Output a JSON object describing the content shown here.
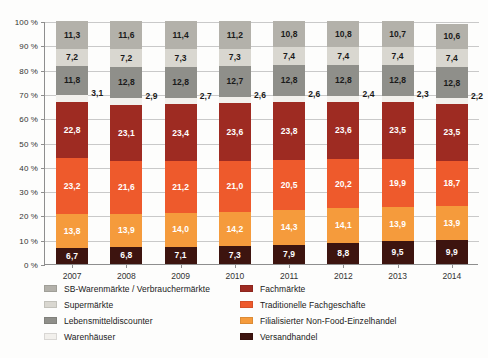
{
  "chart_data": {
    "type": "bar",
    "subtype": "stacked-percentage-column",
    "title": "",
    "xlabel": "",
    "ylabel": "",
    "ylim": [
      0,
      100
    ],
    "ytick_labels": [
      "0 %",
      "10 %",
      "20 %",
      "30 %",
      "40 %",
      "50 %",
      "60 %",
      "70 %",
      "80 %",
      "90 %",
      "100 %"
    ],
    "ytick_values": [
      0,
      10,
      20,
      30,
      40,
      50,
      60,
      70,
      80,
      90,
      100
    ],
    "grid": true,
    "legend_position": "bottom",
    "categories": [
      "2007",
      "2008",
      "2009",
      "2010",
      "2011",
      "2012",
      "2013",
      "2014"
    ],
    "stack_order_bottom_to_top": [
      "Versandhandel",
      "Filialisierter Non-Food-Einzelhandel",
      "Traditionelle Fachgeschäfte",
      "Fachmärkte",
      "Warenhäuser",
      "Lebensmitteldiscounter",
      "Supermärkte",
      "SB-Warenmärkte / Verbrauchermärkte"
    ],
    "series": [
      {
        "name": "Versandhandel",
        "color": "#3d140f",
        "label_color": "#ffffff",
        "label_position": "inside",
        "values": [
          6.7,
          6.8,
          7.1,
          7.3,
          7.9,
          8.8,
          9.5,
          9.9
        ],
        "value_labels": [
          "6,7",
          "6,8",
          "7,1",
          "7,3",
          "7,9",
          "8,8",
          "9,5",
          "9,9"
        ]
      },
      {
        "name": "Filialisierter Non-Food-Einzelhandel",
        "color": "#f59b3c",
        "label_color": "#ffffff",
        "label_position": "inside",
        "values": [
          13.8,
          13.9,
          14.0,
          14.2,
          14.3,
          14.1,
          13.9,
          13.9
        ],
        "value_labels": [
          "13,8",
          "13,9",
          "14,0",
          "14,2",
          "14,3",
          "14,1",
          "13,9",
          "13,9"
        ]
      },
      {
        "name": "Traditionelle Fachgeschäfte",
        "color": "#ee5a2c",
        "label_color": "#ffffff",
        "label_position": "inside",
        "values": [
          23.2,
          21.6,
          21.2,
          21.0,
          20.5,
          20.2,
          19.9,
          18.7
        ],
        "value_labels": [
          "23,2",
          "21,6",
          "21,2",
          "21,0",
          "20,5",
          "20,2",
          "19,9",
          "18,7"
        ]
      },
      {
        "name": "Fachmärkte",
        "color": "#9e2b22",
        "label_color": "#ffffff",
        "label_position": "inside",
        "values": [
          22.8,
          23.1,
          23.4,
          23.6,
          23.8,
          23.6,
          23.5,
          23.5
        ],
        "value_labels": [
          "22,8",
          "23,1",
          "23,4",
          "23,6",
          "23,8",
          "23,6",
          "23,5",
          "23,5"
        ]
      },
      {
        "name": "Warenhäuser",
        "color": "#f2f0ec",
        "label_color": "#1a1a1a",
        "label_position": "outside-right",
        "values": [
          3.1,
          2.9,
          2.7,
          2.6,
          2.6,
          2.4,
          2.3,
          2.2
        ],
        "value_labels": [
          "3,1",
          "2,9",
          "2,7",
          "2,6",
          "2,6",
          "2,4",
          "2,3",
          "2,2"
        ]
      },
      {
        "name": "Lebensmitteldiscounter",
        "color": "#8f8f8a",
        "label_color": "#1a1a1a",
        "label_position": "inside",
        "values": [
          11.8,
          12.8,
          12.8,
          12.7,
          12.8,
          12.8,
          12.8,
          12.8
        ],
        "value_labels": [
          "11,8",
          "12,8",
          "12,8",
          "12,7",
          "12,8",
          "12,8",
          "12,8",
          "12,8"
        ]
      },
      {
        "name": "Supermärkte",
        "color": "#d9d7d0",
        "label_color": "#1a1a1a",
        "label_position": "inside",
        "values": [
          7.2,
          7.2,
          7.3,
          7.3,
          7.4,
          7.4,
          7.4,
          7.4
        ],
        "value_labels": [
          "7,2",
          "7,2",
          "7,3",
          "7,3",
          "7,4",
          "7,4",
          "7,4",
          "7,4"
        ]
      },
      {
        "name": "SB-Warenmärkte / Verbrauchermärkte",
        "color": "#b3b1aa",
        "label_color": "#1a1a1a",
        "label_position": "inside",
        "values": [
          11.3,
          11.6,
          11.4,
          11.2,
          10.8,
          10.8,
          10.7,
          10.6
        ],
        "value_labels": [
          "11,3",
          "11,6",
          "11,4",
          "11,2",
          "10,8",
          "10,8",
          "10,7",
          "10,6"
        ]
      }
    ]
  },
  "legend": {
    "left_column": [
      {
        "label": "SB-Warenmärkte / Verbrauchermärkte",
        "color": "#b3b1aa"
      },
      {
        "label": "Supermärkte",
        "color": "#d9d7d0"
      },
      {
        "label": "Lebensmitteldiscounter",
        "color": "#8f8f8a"
      },
      {
        "label": "Warenhäuser",
        "color": "#f2f0ec"
      }
    ],
    "right_column": [
      {
        "label": "Fachmärkte",
        "color": "#9e2b22"
      },
      {
        "label": "Traditionelle Fachgeschäfte",
        "color": "#ee5a2c"
      },
      {
        "label": "Filialisierter Non-Food-Einzelhandel",
        "color": "#f59b3c"
      },
      {
        "label": "Versandhandel",
        "color": "#3d140f"
      }
    ]
  }
}
